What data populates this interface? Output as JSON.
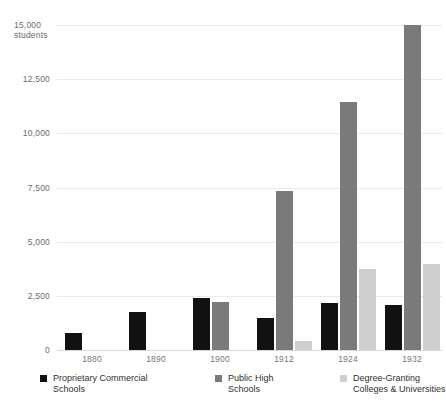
{
  "chart": {
    "type": "bar",
    "units_note": "students",
    "axis_top_label": "15,000",
    "ylabel": "students"
  },
  "chart_data": {
    "type": "bar",
    "title": "",
    "subtitle": "",
    "xlabel": "",
    "ylabel": "students",
    "ylim": [
      0,
      15000
    ],
    "yticks": [
      0,
      2500,
      5000,
      7500,
      10000,
      12500,
      15000
    ],
    "ytick_labels": [
      "0",
      "2,500",
      "5,000",
      "7,500",
      "10,000",
      "12,500",
      "15,000"
    ],
    "y_unit_annotation": "students",
    "grid": true,
    "legend_position": "bottom",
    "categories": [
      "1880",
      "1890",
      "1900",
      "1912",
      "1924",
      "1932"
    ],
    "series": [
      {
        "name": "Proprietary Commercial Schools",
        "color": "#111111",
        "values": [
          800,
          1750,
          2400,
          1500,
          2150,
          2100
        ]
      },
      {
        "name": "Public High Schools",
        "color": "#7a7a7a",
        "values": [
          0,
          0,
          2200,
          7350,
          11450,
          15000
        ]
      },
      {
        "name": "Degree-Granting Colleges & Universities",
        "color": "#cfcfcf",
        "values": [
          0,
          0,
          0,
          400,
          3750,
          3950
        ]
      }
    ]
  },
  "y_ticks": [
    {
      "label": "15,000",
      "value": 15000
    },
    {
      "label": "12,500",
      "value": 12500
    },
    {
      "label": "10,000",
      "value": 10000
    },
    {
      "label": "7,500",
      "value": 7500
    },
    {
      "label": "5,000",
      "value": 5000
    },
    {
      "label": "2,500",
      "value": 2500
    },
    {
      "label": "0",
      "value": 0
    }
  ],
  "x_ticks": [
    {
      "label": "1880"
    },
    {
      "label": "1890"
    },
    {
      "label": "1900"
    },
    {
      "label": "1912"
    },
    {
      "label": "1924"
    },
    {
      "label": "1932"
    }
  ],
  "legend": {
    "items": [
      {
        "label": "Proprietary Commercial\nSchools",
        "color": "#111111"
      },
      {
        "label": "Public High\nSchools",
        "color": "#7a7a7a"
      },
      {
        "label": "Degree-Granting\nColleges & Universities",
        "color": "#cfcfcf"
      }
    ]
  }
}
